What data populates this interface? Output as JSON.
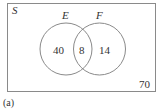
{
  "diagram": {
    "type": "venn",
    "universe_label": "S",
    "sets": [
      {
        "name": "E",
        "only_count": "40"
      },
      {
        "name": "F",
        "only_count": "14"
      }
    ],
    "intersection_count": "8",
    "outside_count": "70",
    "caption": "(a)"
  },
  "colors": {
    "stroke": "#8a8a8a",
    "text": "#333333",
    "background": "#ffffff"
  }
}
